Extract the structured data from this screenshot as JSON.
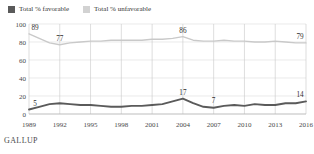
{
  "legend": {
    "items": [
      {
        "label": "Total % favorable",
        "color": "#5a5a5a",
        "icon": "square-swatch-icon"
      },
      {
        "label": "Total % unfavorable",
        "color": "#c9c9c9",
        "icon": "square-swatch-icon"
      }
    ]
  },
  "footer": {
    "brand": "GALLUP"
  },
  "chart_data": {
    "type": "line",
    "title": "",
    "subtitle": "",
    "xlabel": "",
    "ylabel": "",
    "ylim": [
      0,
      100
    ],
    "yticks": [
      0,
      20,
      40,
      60,
      80,
      100
    ],
    "xlim": [
      1989,
      2016
    ],
    "xticks": [
      1989,
      1992,
      1995,
      1998,
      2001,
      2004,
      2007,
      2010,
      2013,
      2016
    ],
    "grid": true,
    "legend_position": "top-left",
    "x": [
      1989,
      1990,
      1991,
      1992,
      1993,
      1994,
      1995,
      1996,
      1997,
      1998,
      1999,
      2000,
      2001,
      2002,
      2003,
      2004,
      2005,
      2006,
      2007,
      2008,
      2009,
      2010,
      2011,
      2012,
      2013,
      2014,
      2015,
      2016
    ],
    "series": [
      {
        "name": "Total % unfavorable",
        "color": "#c9c9c9",
        "values": [
          89,
          84,
          79,
          77,
          79,
          80,
          81,
          81,
          82,
          82,
          82,
          82,
          83,
          83,
          84,
          86,
          82,
          81,
          81,
          82,
          81,
          81,
          80,
          80,
          81,
          80,
          79,
          79
        ]
      },
      {
        "name": "Total % favorable",
        "color": "#5a5a5a",
        "values": [
          5,
          8,
          11,
          12,
          11,
          10,
          10,
          9,
          8,
          8,
          9,
          9,
          10,
          11,
          14,
          17,
          12,
          8,
          7,
          9,
          10,
          9,
          11,
          10,
          10,
          12,
          12,
          14
        ]
      }
    ],
    "point_labels": [
      {
        "series": "Total % unfavorable",
        "x": 1989,
        "value": 89,
        "text": "89"
      },
      {
        "series": "Total % unfavorable",
        "x": 1992,
        "value": 77,
        "text": "77"
      },
      {
        "series": "Total % unfavorable",
        "x": 2004,
        "value": 86,
        "text": "86"
      },
      {
        "series": "Total % unfavorable",
        "x": 2016,
        "value": 79,
        "text": "79"
      },
      {
        "series": "Total % favorable",
        "x": 1989,
        "value": 5,
        "text": "5"
      },
      {
        "series": "Total % favorable",
        "x": 2004,
        "value": 17,
        "text": "17"
      },
      {
        "series": "Total % favorable",
        "x": 2007,
        "value": 7,
        "text": "7"
      },
      {
        "series": "Total % favorable",
        "x": 2016,
        "value": 14,
        "text": "14"
      }
    ]
  }
}
